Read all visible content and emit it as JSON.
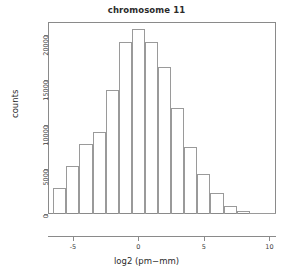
{
  "chart_data": {
    "type": "bar",
    "title": "chromosome 11",
    "xlabel": "log2 (pm−mm)",
    "ylabel": "counts",
    "grid": false,
    "legend": null,
    "xlim": [
      -6.9,
      10.5
    ],
    "ylim": [
      0,
      21500
    ],
    "bin_width": 1,
    "bin_starts": [
      -6.5,
      -5.5,
      -4.5,
      -3.5,
      -2.5,
      -1.5,
      -0.5,
      0.5,
      1.5,
      2.5,
      3.5,
      4.5,
      5.5,
      6.5,
      7.5,
      8.5,
      9.5
    ],
    "categories": [
      "-6.5",
      "-5.5",
      "-4.5",
      "-3.5",
      "-2.5",
      "-1.5",
      "-0.5",
      "0.5",
      "1.5",
      "2.5",
      "3.5",
      "4.5",
      "5.5",
      "6.5",
      "7.5",
      "8.5",
      "9.5"
    ],
    "values": [
      2900,
      5400,
      7800,
      9200,
      13900,
      19300,
      20700,
      19300,
      16500,
      11900,
      7500,
      4500,
      2400,
      850,
      350,
      120,
      30
    ],
    "xticks": [
      -5,
      0,
      5,
      10
    ],
    "xtick_labels": [
      "-5",
      "0",
      "5",
      "10"
    ],
    "yticks": [
      0,
      5000,
      10000,
      15000,
      20000
    ],
    "ytick_labels": [
      "0",
      "5000",
      "10000",
      "15000",
      "20000"
    ]
  },
  "colors": {
    "bar_stroke": "#9a9a9a",
    "axis": "#8a8a8a",
    "text": "#2b2b2b",
    "background": "#ffffff"
  }
}
